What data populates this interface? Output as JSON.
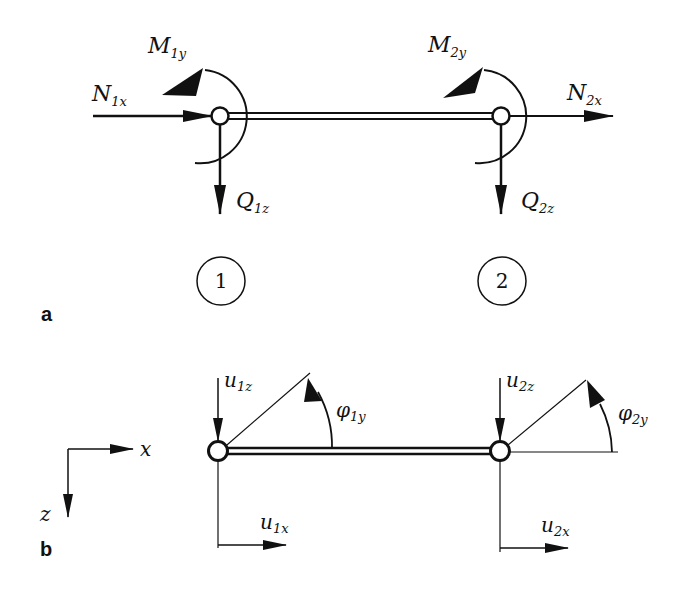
{
  "panels": {
    "a": {
      "label": "a",
      "forces": {
        "N1x": {
          "main": "N",
          "sub": "1x"
        },
        "M1y": {
          "main": "M",
          "sub": "1y"
        },
        "Q1z": {
          "main": "Q",
          "sub": "1z"
        },
        "N2x": {
          "main": "N",
          "sub": "2x"
        },
        "M2y": {
          "main": "M",
          "sub": "2y"
        },
        "Q2z": {
          "main": "Q",
          "sub": "2z"
        }
      },
      "nodes": [
        "1",
        "2"
      ]
    },
    "b": {
      "label": "b",
      "axes": {
        "x": "x",
        "z": "z"
      },
      "displacements": {
        "u1z": {
          "main": "u",
          "sub": "1z"
        },
        "u1x": {
          "main": "u",
          "sub": "1x"
        },
        "phi1y": {
          "main": "φ",
          "sub": "1y"
        },
        "u2z": {
          "main": "u",
          "sub": "2z"
        },
        "u2x": {
          "main": "u",
          "sub": "2x"
        },
        "phi2y": {
          "main": "φ",
          "sub": "2y"
        }
      }
    }
  },
  "colors": {
    "stroke": "#111111",
    "background": "#ffffff"
  }
}
